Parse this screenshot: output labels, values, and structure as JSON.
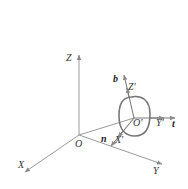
{
  "diagram": {
    "type": "coordinate-frame-diagram",
    "global_frame": {
      "origin_label": "O",
      "axes": [
        {
          "name": "X",
          "label": "X"
        },
        {
          "name": "Y",
          "label": "Y"
        },
        {
          "name": "Z",
          "label": "Z"
        }
      ]
    },
    "local_frame": {
      "origin_label": "O'",
      "axes": [
        {
          "name": "X'",
          "label": "X'",
          "unit_vector_label": "n"
        },
        {
          "name": "Y'",
          "label": "Y'",
          "unit_vector_label": "t"
        },
        {
          "name": "Z'",
          "label": "Z'",
          "unit_vector_label": "b"
        }
      ]
    },
    "shapes": [
      {
        "kind": "closed-loop",
        "around": "O'"
      },
      {
        "kind": "position-line",
        "from": "O",
        "to": "O'"
      }
    ],
    "colors": {
      "axis": "#9a9a9a",
      "loop": "#777777",
      "text": "#333333"
    }
  }
}
